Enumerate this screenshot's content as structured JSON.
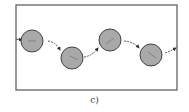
{
  "diagram": {
    "caption": "c)",
    "frame": {
      "x": 16,
      "y": 5,
      "width": 161,
      "height": 85,
      "stroke": "#555555"
    },
    "circle_fill": "#a9a9a9",
    "circle_stroke": "#444444",
    "circles": [
      {
        "cx": 32,
        "cy": 41,
        "r": 11
      },
      {
        "cx": 72,
        "cy": 58,
        "r": 11
      },
      {
        "cx": 110,
        "cy": 40,
        "r": 11
      },
      {
        "cx": 151,
        "cy": 55,
        "r": 11
      }
    ],
    "arrows": [
      {
        "from": "left-edge",
        "to": "circle-1"
      },
      {
        "from": "circle-1",
        "to": "circle-2"
      },
      {
        "from": "circle-2",
        "to": "circle-3"
      },
      {
        "from": "circle-3",
        "to": "circle-4"
      },
      {
        "from": "circle-4",
        "to": "right-edge"
      }
    ]
  }
}
